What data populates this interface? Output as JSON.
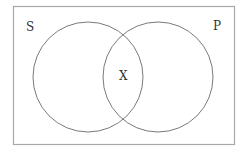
{
  "diagram": {
    "type": "venn",
    "universe_label": "S",
    "sets": [
      {
        "name": "S-set",
        "label": ""
      },
      {
        "name": "P-set",
        "label": "P"
      }
    ],
    "intersection_label": "X",
    "colors": {
      "frame": "#a8a8a8",
      "circle": "#7a7a7a",
      "text": "#333333",
      "background": "#ffffff"
    }
  }
}
